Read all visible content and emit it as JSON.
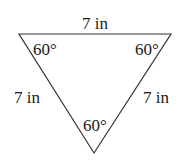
{
  "diagram": {
    "type": "equilateral-triangle",
    "sides": {
      "top": "7 in",
      "left": "7 in",
      "right": "7 in"
    },
    "angles": {
      "top_left": "60°",
      "top_right": "60°",
      "bottom": "60°"
    },
    "colors": {
      "stroke": "#333333",
      "text": "#1a1a1a",
      "background": "#ffffff"
    }
  }
}
